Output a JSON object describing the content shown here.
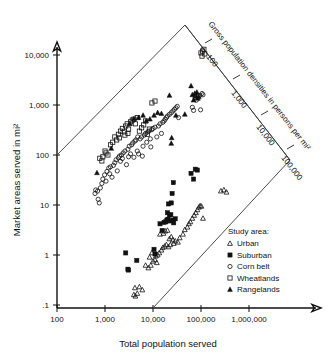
{
  "chart_data": {
    "type": "scatter",
    "title": "",
    "xlabel": "Total population served",
    "ylabel": "Market areas served in mi²",
    "xscale": "log",
    "yscale": "log",
    "xlim": [
      100,
      3000000
    ],
    "ylim": [
      0.1,
      30000
    ],
    "grid": false,
    "xticks": [
      100,
      1000,
      10000,
      100000,
      1000000
    ],
    "xticklabels": [
      "100",
      "1,000",
      "10,000",
      "100,000",
      "1,000,000"
    ],
    "yticks": [
      0.1,
      1,
      10,
      100,
      1000,
      10000
    ],
    "yticklabels": [
      ".1",
      "1",
      "10",
      "100",
      "1,000",
      "10,000"
    ],
    "secondary_axis": {
      "label": "Gross population densities in persons per mi²",
      "ticks": [
        100,
        1000,
        10000,
        100000
      ],
      "ticklabels": [
        "100",
        "1,000",
        "10,000",
        "100,000"
      ],
      "orientation": "diagonal",
      "note": "density = population / market area; constant-density lines run diagonally"
    },
    "legend_position": "bottom-right",
    "legend_title": "Study area:",
    "series": [
      {
        "name": "Urban",
        "marker": "open-triangle",
        "points": [
          [
            4000,
            0.16
          ],
          [
            4300,
            0.15
          ],
          [
            4700,
            0.17
          ],
          [
            4200,
            0.22
          ],
          [
            5200,
            0.23
          ],
          [
            6000,
            0.2
          ],
          [
            8000,
            0.55
          ],
          [
            9000,
            0.62
          ],
          [
            10000,
            0.75
          ],
          [
            11000,
            0.8
          ],
          [
            12000,
            0.7
          ],
          [
            12500,
            1.0
          ],
          [
            13500,
            1.1
          ],
          [
            15000,
            1.25
          ],
          [
            16000,
            1.4
          ],
          [
            17500,
            1.5
          ],
          [
            19000,
            1.6
          ],
          [
            21000,
            1.45
          ],
          [
            22000,
            2.1
          ],
          [
            24000,
            2.3
          ],
          [
            14000,
            2.6
          ],
          [
            16500,
            2.7
          ],
          [
            18000,
            3.0
          ],
          [
            20000,
            3.1
          ],
          [
            26000,
            2.0
          ],
          [
            29000,
            1.9
          ],
          [
            33000,
            1.8
          ],
          [
            36000,
            2.2
          ],
          [
            42000,
            2.6
          ],
          [
            46000,
            3.2
          ],
          [
            52000,
            3.6
          ],
          [
            56000,
            4.2
          ],
          [
            60000,
            4.6
          ],
          [
            66000,
            5.4
          ],
          [
            72000,
            6.2
          ],
          [
            78000,
            7.0
          ],
          [
            84000,
            8.0
          ],
          [
            90000,
            9.0
          ],
          [
            96000,
            9.6
          ],
          [
            102000,
            9.4
          ],
          [
            110000,
            5.4
          ],
          [
            260000,
            19
          ],
          [
            300000,
            20
          ],
          [
            340000,
            18
          ],
          [
            7000,
            0.62
          ],
          [
            8500,
            0.9
          ],
          [
            9500,
            1.1
          ],
          [
            11500,
            0.95
          ],
          [
            23000,
            1.6
          ],
          [
            27000,
            1.7
          ]
        ]
      },
      {
        "name": "Suburban",
        "marker": "filled-square",
        "points": [
          [
            2700,
            1.1
          ],
          [
            3000,
            0.52
          ],
          [
            3100,
            0.5
          ],
          [
            4600,
            0.78
          ],
          [
            10500,
            1.3
          ],
          [
            11000,
            1.05
          ],
          [
            14000,
            4.2
          ],
          [
            15500,
            3.1
          ],
          [
            17000,
            4.5
          ],
          [
            18500,
            4.6
          ],
          [
            19500,
            5.0
          ],
          [
            20500,
            5.2
          ],
          [
            22000,
            6.3
          ],
          [
            23500,
            6.4
          ],
          [
            26000,
            5.0
          ],
          [
            27000,
            4.4
          ],
          [
            29000,
            5.3
          ],
          [
            21000,
            10.5
          ],
          [
            24000,
            11
          ],
          [
            25000,
            17
          ],
          [
            26500,
            28
          ],
          [
            62000,
            43
          ],
          [
            70000,
            33
          ],
          [
            76000,
            52
          ],
          [
            84000,
            50
          ],
          [
            20000,
            7.0
          ],
          [
            23000,
            4.8
          ]
        ]
      },
      {
        "name": "Corn belt",
        "marker": "open-circle",
        "points": [
          [
            620,
            17
          ],
          [
            640,
            20
          ],
          [
            700,
            19
          ],
          [
            720,
            13
          ],
          [
            760,
            11
          ],
          [
            800,
            22
          ],
          [
            860,
            27
          ],
          [
            900,
            33
          ],
          [
            980,
            40
          ],
          [
            1050,
            30
          ],
          [
            1100,
            47
          ],
          [
            1200,
            55
          ],
          [
            1300,
            58
          ],
          [
            1400,
            36
          ],
          [
            1500,
            62
          ],
          [
            1600,
            70
          ],
          [
            1700,
            80
          ],
          [
            1800,
            48
          ],
          [
            1900,
            88
          ],
          [
            2000,
            95
          ],
          [
            2100,
            75
          ],
          [
            2200,
            100
          ],
          [
            2400,
            110
          ],
          [
            2600,
            120
          ],
          [
            2800,
            64
          ],
          [
            3000,
            130
          ],
          [
            3200,
            150
          ],
          [
            3400,
            105
          ],
          [
            3600,
            160
          ],
          [
            3800,
            175
          ],
          [
            4000,
            90
          ],
          [
            4200,
            190
          ],
          [
            4400,
            200
          ],
          [
            4700,
            120
          ],
          [
            5000,
            105
          ],
          [
            5400,
            210
          ],
          [
            5800,
            230
          ],
          [
            6200,
            150
          ],
          [
            6600,
            250
          ],
          [
            7000,
            270
          ],
          [
            7400,
            180
          ],
          [
            7800,
            290
          ],
          [
            8200,
            300
          ],
          [
            8800,
            210
          ],
          [
            9400,
            320
          ],
          [
            10000,
            340
          ],
          [
            11000,
            360
          ],
          [
            12000,
            230
          ],
          [
            13000,
            380
          ],
          [
            14000,
            420
          ],
          [
            15000,
            270
          ],
          [
            16000,
            450
          ],
          [
            17000,
            480
          ],
          [
            18000,
            520
          ],
          [
            19000,
            560
          ],
          [
            20000,
            600
          ],
          [
            22000,
            650
          ],
          [
            24000,
            700
          ],
          [
            26000,
            760
          ],
          [
            28000,
            820
          ],
          [
            30000,
            880
          ],
          [
            32000,
            940
          ],
          [
            34000,
            560
          ],
          [
            75000,
            1400
          ],
          [
            80000,
            1250
          ],
          [
            88000,
            1500
          ],
          [
            95000,
            1550
          ],
          [
            105000,
            1700
          ],
          [
            110000,
            1600
          ],
          [
            66000,
            900
          ],
          [
            70000,
            780
          ],
          [
            98000,
            800
          ],
          [
            1250,
            42
          ],
          [
            2300,
            85
          ],
          [
            3100,
            92
          ],
          [
            4800,
            230
          ],
          [
            6000,
            95
          ],
          [
            9000,
            145
          ]
        ]
      },
      {
        "name": "Wheatlands",
        "marker": "open-square",
        "points": [
          [
            780,
            86
          ],
          [
            900,
            92
          ],
          [
            1000,
            120
          ],
          [
            1150,
            100
          ],
          [
            1300,
            160
          ],
          [
            1450,
            180
          ],
          [
            1600,
            230
          ],
          [
            1750,
            200
          ],
          [
            1900,
            260
          ],
          [
            2100,
            300
          ],
          [
            2300,
            340
          ],
          [
            2500,
            290
          ],
          [
            2700,
            380
          ],
          [
            2900,
            420
          ],
          [
            3100,
            330
          ],
          [
            3400,
            460
          ],
          [
            3700,
            500
          ],
          [
            4000,
            520
          ],
          [
            4300,
            420
          ],
          [
            4700,
            560
          ],
          [
            5200,
            300
          ],
          [
            5800,
            350
          ],
          [
            6400,
            400
          ],
          [
            7000,
            480
          ],
          [
            7600,
            260
          ],
          [
            8400,
            330
          ],
          [
            9500,
            1100
          ],
          [
            11000,
            1200
          ],
          [
            100000,
            11000
          ],
          [
            108000,
            12000
          ],
          [
            115000,
            13000
          ],
          [
            105000,
            9500
          ],
          [
            120000,
            10500
          ],
          [
            860,
            76
          ],
          [
            1050,
            110
          ],
          [
            2000,
            220
          ],
          [
            2600,
            250
          ],
          [
            3000,
            270
          ]
        ]
      },
      {
        "name": "Rangelands",
        "marker": "filled-triangle",
        "points": [
          [
            680,
            44
          ],
          [
            1350,
            135
          ],
          [
            3300,
            420
          ],
          [
            4000,
            530
          ],
          [
            5000,
            560
          ],
          [
            6200,
            620
          ],
          [
            7200,
            480
          ],
          [
            8600,
            520
          ],
          [
            10500,
            620
          ],
          [
            12500,
            700
          ],
          [
            15000,
            670
          ],
          [
            22000,
            1550
          ],
          [
            24000,
            170
          ],
          [
            24500,
            220
          ],
          [
            62000,
            2400
          ],
          [
            66000,
            1600
          ],
          [
            70000,
            1250
          ],
          [
            74000,
            1700
          ],
          [
            78000,
            1500
          ],
          [
            82000,
            1800
          ],
          [
            86000,
            1350
          ],
          [
            90000,
            1450
          ],
          [
            30000,
            620
          ],
          [
            46000,
            650
          ]
        ]
      }
    ]
  },
  "axes": {
    "x_title": "Total population served",
    "y_title": "Market areas served in mi²",
    "x_ticklabels": [
      "100",
      "1,000",
      "10,000",
      "100,000",
      "1,000,000"
    ],
    "y_ticklabels": [
      ".1",
      "1",
      "10",
      "100",
      "1,000",
      "10,000"
    ]
  },
  "density_axis": {
    "title": "Gross population densities in persons per mi²",
    "ticklabels": [
      "100",
      "1,000",
      "10,000",
      "100,000"
    ]
  },
  "legend": {
    "title": "Study area:",
    "items": [
      {
        "label": "Urban",
        "marker": "open-triangle"
      },
      {
        "label": "Suburban",
        "marker": "filled-square"
      },
      {
        "label": "Corn belt",
        "marker": "open-circle"
      },
      {
        "label": "Wheatlands",
        "marker": "open-square"
      },
      {
        "label": "Rangelands",
        "marker": "filled-triangle"
      }
    ]
  },
  "colors": {
    "ink": "#111111",
    "frame": "#3a3a3a",
    "background": "#ffffff"
  }
}
